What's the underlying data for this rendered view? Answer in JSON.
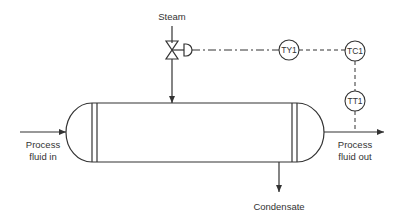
{
  "diagram": {
    "type": "P&ID heat exchanger temperature control loop",
    "labels": {
      "steam": "Steam",
      "process_in_1": "Process",
      "process_in_2": "fluid in",
      "process_out_1": "Process",
      "process_out_2": "fluid out",
      "condensate": "Condensate"
    },
    "instruments": [
      {
        "tag": "TY1",
        "role": "transducer"
      },
      {
        "tag": "TC1",
        "role": "temperature controller"
      },
      {
        "tag": "TT1",
        "role": "temperature transmitter"
      }
    ],
    "colors": {
      "line": "#333333",
      "background": "#ffffff"
    }
  }
}
